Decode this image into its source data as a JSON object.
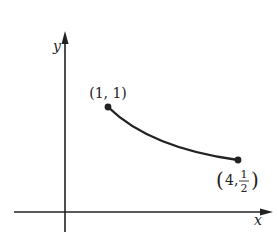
{
  "diagram": {
    "axes": {
      "x_label": "x",
      "y_label": "y"
    },
    "points": [
      {
        "label": "(1, 1)",
        "x": 1,
        "y": 1
      },
      {
        "label_prefix": "(4, ",
        "label_num": "1",
        "label_den": "2",
        "label_suffix": ")",
        "x": 4,
        "y": 0.5
      }
    ],
    "curve": "decreasing curve from (1,1) to (4,1/2)",
    "colors": {
      "ink": "#222222",
      "background": "#ffffff"
    }
  }
}
